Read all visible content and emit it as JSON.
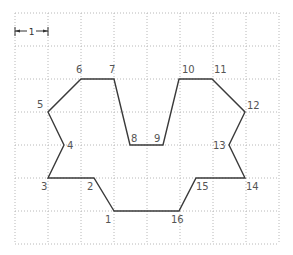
{
  "diagram": {
    "type": "polygon-on-grid",
    "grid": {
      "origin_px": [
        15,
        13
      ],
      "cell_px": 33,
      "columns": 8,
      "rows": 7,
      "line_color": "#b8b8b8"
    },
    "scale_marker": {
      "label": "1",
      "from_px": [
        15,
        31
      ],
      "to_px": [
        48,
        31
      ]
    },
    "shape_color": "#3a3a3a",
    "label_color": "#555555",
    "points": [
      {
        "id": "1",
        "x": 114,
        "y": 211,
        "label": "1",
        "lx": 105,
        "ly": 223
      },
      {
        "id": "2",
        "x": 94,
        "y": 178,
        "label": "2",
        "lx": 87,
        "ly": 190
      },
      {
        "id": "3",
        "x": 48,
        "y": 178,
        "label": "3",
        "lx": 41,
        "ly": 190
      },
      {
        "id": "4",
        "x": 64,
        "y": 145,
        "label": "4",
        "lx": 67,
        "ly": 149
      },
      {
        "id": "5",
        "x": 48,
        "y": 112,
        "label": "5",
        "lx": 37,
        "ly": 108
      },
      {
        "id": "6",
        "x": 81,
        "y": 79,
        "label": "6",
        "lx": 76,
        "ly": 73
      },
      {
        "id": "7",
        "x": 114,
        "y": 79,
        "label": "7",
        "lx": 109,
        "ly": 73
      },
      {
        "id": "8",
        "x": 130,
        "y": 145,
        "label": "8",
        "lx": 131,
        "ly": 142
      },
      {
        "id": "9",
        "x": 163,
        "y": 145,
        "label": "9",
        "lx": 154,
        "ly": 142
      },
      {
        "id": "10",
        "x": 179,
        "y": 79,
        "label": "10",
        "lx": 182,
        "ly": 73
      },
      {
        "id": "11",
        "x": 212,
        "y": 79,
        "label": "11",
        "lx": 214,
        "ly": 73
      },
      {
        "id": "12",
        "x": 245,
        "y": 112,
        "label": "12",
        "lx": 247,
        "ly": 109
      },
      {
        "id": "13",
        "x": 229,
        "y": 145,
        "label": "13",
        "lx": 213,
        "ly": 149
      },
      {
        "id": "14",
        "x": 245,
        "y": 178,
        "label": "14",
        "lx": 246,
        "ly": 190
      },
      {
        "id": "15",
        "x": 196,
        "y": 178,
        "label": "15",
        "lx": 196,
        "ly": 190
      },
      {
        "id": "16",
        "x": 179,
        "y": 211,
        "label": "16",
        "lx": 171,
        "ly": 223
      }
    ]
  }
}
